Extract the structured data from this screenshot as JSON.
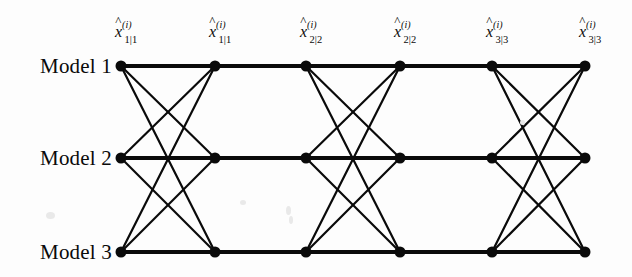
{
  "figure": {
    "type": "diagram",
    "background_color": "#fdfdfd",
    "line_color": "#0a0a0a",
    "node_color": "#0a0a0a"
  },
  "rows": [
    {
      "label": "Model 1",
      "y": 66
    },
    {
      "label": "Model 2",
      "y": 158
    },
    {
      "label": "Model 3",
      "y": 252
    }
  ],
  "columns": [
    {
      "x": 121,
      "label": {
        "var": "x",
        "hat": "^",
        "sup": "(i)",
        "sub": "1|1"
      }
    },
    {
      "x": 215,
      "label": {
        "var": "x",
        "hat": "^",
        "sup": "(i)",
        "sub": "1|1"
      }
    },
    {
      "x": 306,
      "label": {
        "var": "x",
        "hat": "^",
        "sup": "(i)",
        "sub": "2|2"
      }
    },
    {
      "x": 400,
      "label": {
        "var": "x",
        "hat": "^",
        "sup": "(i)",
        "sub": "2|2"
      }
    },
    {
      "x": 492,
      "label": {
        "var": "x",
        "hat": "^",
        "sup": "(i)",
        "sub": "3|3"
      }
    },
    {
      "x": 585,
      "label": {
        "var": "x",
        "hat": "^",
        "sup": "(i)",
        "sub": "3|3"
      }
    }
  ],
  "edges": {
    "fully_connected_column_pairs": [
      [
        0,
        1
      ],
      [
        2,
        3
      ],
      [
        4,
        5
      ]
    ],
    "horizontal_only_column_pairs": [
      [
        1,
        2
      ],
      [
        3,
        4
      ]
    ],
    "node_radius": 5.5,
    "horizontal_stroke_width": 4.2,
    "cross_stroke_width": 2.2
  },
  "labels_position": {
    "row_label_right_edge_x": 112,
    "node_label_offset_x": 2,
    "node_label_offset_y": -40
  }
}
